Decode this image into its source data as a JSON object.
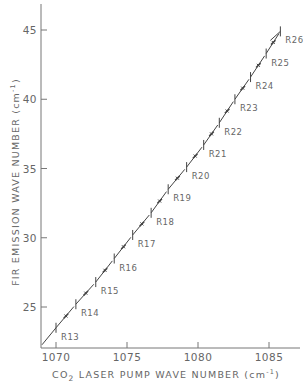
{
  "chart_data": {
    "type": "line",
    "title": "",
    "xlabel": "CO2 LASER PUMP WAVE NUMBER (cm⁻¹)",
    "ylabel": "FIR EMISSION WAVE NUMBER (cm⁻¹)",
    "xlim": [
      1068.8,
      1087.5
    ],
    "ylim": [
      22.2,
      47.3
    ],
    "x_ticks": [
      1070,
      1075,
      1080,
      1085
    ],
    "y_ticks": [
      25,
      30,
      35,
      40,
      45
    ],
    "grid": false,
    "legend": null,
    "series": [
      {
        "name": "R-branch lines",
        "labels": [
          "R13",
          "R14",
          "R15",
          "R16",
          "R17",
          "R18",
          "R19",
          "R20",
          "R21",
          "R22",
          "R23",
          "R24",
          "R25",
          "R26"
        ],
        "x": [
          1070.0,
          1071.4,
          1072.8,
          1074.1,
          1075.4,
          1076.7,
          1077.9,
          1079.2,
          1080.4,
          1081.5,
          1082.6,
          1083.7,
          1084.8,
          1085.8
        ],
        "y": [
          23.5,
          25.2,
          26.8,
          28.5,
          30.2,
          31.8,
          33.5,
          35.1,
          36.7,
          38.3,
          40.0,
          41.6,
          43.3,
          44.9
        ]
      }
    ]
  },
  "axes": {
    "x_tick_labels": [
      "1070",
      "1075",
      "1080",
      "1085"
    ],
    "y_tick_labels": [
      "25",
      "30",
      "35",
      "40",
      "45"
    ],
    "x_title_prefix": "CO",
    "x_title_sub": "2",
    "x_title_rest": " LASER PUMP WAVE NUMBER (cm",
    "x_title_sup": "-1",
    "x_title_end": ")",
    "y_title_main": "FIR EMISSION WAVE NUMBER (cm",
    "y_title_sup": "-1",
    "y_title_end": ")"
  },
  "colors": {
    "axis": "#777777",
    "line": "#444444",
    "text": "#666666"
  }
}
